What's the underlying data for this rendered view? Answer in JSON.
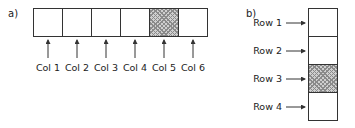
{
  "panel_a": {
    "label": "a)",
    "columns": [
      {
        "label": "Col 1",
        "highlighted": false
      },
      {
        "label": "Col 2",
        "highlighted": false
      },
      {
        "label": "Col 3",
        "highlighted": false
      },
      {
        "label": "Col 4",
        "highlighted": false
      },
      {
        "label": "Col 5",
        "highlighted": true
      },
      {
        "label": "Col 6",
        "highlighted": false
      }
    ]
  },
  "panel_b": {
    "label": "b)",
    "rows": [
      {
        "label": "Row 1",
        "highlighted": false
      },
      {
        "label": "Row 2",
        "highlighted": false
      },
      {
        "label": "Row 3",
        "highlighted": true
      },
      {
        "label": "Row 4",
        "highlighted": false
      }
    ]
  },
  "colors": {
    "stroke": "#333333",
    "hatch": "#8a8a8a",
    "hatch_bg": "#cfcfcf"
  }
}
